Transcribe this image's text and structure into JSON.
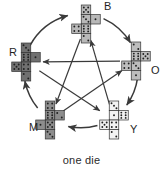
{
  "figure": {
    "caption": "one die",
    "layout": "pentagon"
  },
  "colors": {
    "background": "#ffffff",
    "stroke": "#333333",
    "arrow": "#3a3a3a",
    "label_text": "#1f1f1f",
    "die_R_fill": "#707070",
    "die_B_fill": "#b8b8b8",
    "die_O_fill": "#bdbdbd",
    "die_Y_fill": "#f2f2f2",
    "die_M_fill": "#8d8d8d",
    "pip": "#202020"
  },
  "dice": [
    {
      "id": "B",
      "label": "B",
      "name": "blue-die-net",
      "fill": "#b8b8b8",
      "cx": 86,
      "cy": 24,
      "label_x": 104,
      "label_y": 10,
      "net": "vertical-strip-with-wings",
      "cells": [
        {
          "col": 0,
          "row": 0,
          "pips": 5
        },
        {
          "col": 0,
          "row": 1,
          "pips": 3
        },
        {
          "col": 0,
          "row": 2,
          "pips": 6
        },
        {
          "col": 0,
          "row": 3,
          "pips": 2
        },
        {
          "col": 1,
          "row": 1,
          "pips": 1
        },
        {
          "col": -1,
          "row": 2,
          "pips": 4
        }
      ]
    },
    {
      "id": "O",
      "label": "O",
      "name": "orange-die-net",
      "fill": "#bdbdbd",
      "cx": 136,
      "cy": 61,
      "label_x": 151,
      "label_y": 74,
      "net": "cross",
      "cells": [
        {
          "col": 0,
          "row": 0,
          "pips": 2
        },
        {
          "col": 0,
          "row": 1,
          "pips": 6
        },
        {
          "col": 0,
          "row": 2,
          "pips": 3
        },
        {
          "col": 0,
          "row": 3,
          "pips": 1
        },
        {
          "col": 1,
          "row": 1,
          "pips": 5
        },
        {
          "col": -1,
          "row": 2,
          "pips": 4
        }
      ]
    },
    {
      "id": "Y",
      "label": "Y",
      "name": "yellow-die-net",
      "fill": "#f2f2f2",
      "cx": 114,
      "cy": 120,
      "label_x": 130,
      "label_y": 133,
      "net": "cross",
      "cells": [
        {
          "col": 0,
          "row": 0,
          "pips": 3
        },
        {
          "col": 0,
          "row": 1,
          "pips": 1
        },
        {
          "col": 0,
          "row": 2,
          "pips": 4
        },
        {
          "col": 0,
          "row": 3,
          "pips": 2
        },
        {
          "col": 1,
          "row": 1,
          "pips": 6
        },
        {
          "col": -1,
          "row": 2,
          "pips": 5
        }
      ]
    },
    {
      "id": "M",
      "label": "M",
      "name": "magenta-die-net",
      "fill": "#8d8d8d",
      "cx": 50,
      "cy": 120,
      "label_x": 29,
      "label_y": 131,
      "net": "vertical-strip-with-wings",
      "cells": [
        {
          "col": 0,
          "row": 0,
          "pips": 4
        },
        {
          "col": 0,
          "row": 1,
          "pips": 6
        },
        {
          "col": 0,
          "row": 2,
          "pips": 5
        },
        {
          "col": 0,
          "row": 3,
          "pips": 3
        },
        {
          "col": 1,
          "row": 1,
          "pips": 2
        },
        {
          "col": -1,
          "row": 2,
          "pips": 1
        }
      ]
    },
    {
      "id": "R",
      "label": "R",
      "name": "red-die-net",
      "fill": "#707070",
      "cx": 26,
      "cy": 62,
      "label_x": 9,
      "label_y": 56,
      "net": "cross",
      "cells": [
        {
          "col": 0,
          "row": 0,
          "pips": 3
        },
        {
          "col": 0,
          "row": 1,
          "pips": 6
        },
        {
          "col": 0,
          "row": 2,
          "pips": 4
        },
        {
          "col": 0,
          "row": 3,
          "pips": 2
        },
        {
          "col": 1,
          "row": 1,
          "pips": 1
        },
        {
          "col": -1,
          "row": 2,
          "pips": 5
        }
      ]
    }
  ],
  "outer_arrows": [
    {
      "name": "arrow-R-to-B",
      "from": "R",
      "to": "B"
    },
    {
      "name": "arrow-B-to-O",
      "from": "B",
      "to": "O"
    },
    {
      "name": "arrow-O-to-Y",
      "from": "O",
      "to": "Y"
    },
    {
      "name": "arrow-Y-to-M",
      "from": "Y",
      "to": "M"
    },
    {
      "name": "arrow-M-to-R",
      "from": "M",
      "to": "R"
    }
  ],
  "inner_arrows": [
    {
      "name": "arrow-O-to-R",
      "from": "O",
      "to": "R"
    },
    {
      "name": "arrow-B-to-M",
      "from": "B",
      "to": "M"
    },
    {
      "name": "arrow-M-to-O",
      "from": "M",
      "to": "O"
    },
    {
      "name": "arrow-Y-to-B",
      "from": "Y",
      "to": "B"
    },
    {
      "name": "arrow-R-to-Y",
      "from": "R",
      "to": "Y"
    }
  ]
}
